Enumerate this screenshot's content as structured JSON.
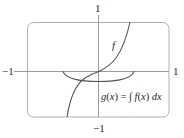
{
  "diagram": {
    "axes": {
      "x_min_label": "−1",
      "x_max_label": "1",
      "y_max_label": "1",
      "y_min_label": "−1"
    },
    "curves": [
      {
        "name": "f",
        "label": "f",
        "shape": "increasing S-curve through origin (cubic-like)"
      },
      {
        "name": "g",
        "label": "g(x) = ∫ f(x) dx",
        "shape": "bowl-shaped curve with minimum below origin, endpoints on x-axis"
      }
    ],
    "formula": {
      "g": "g",
      "open": "(",
      "x1": "x",
      "close": ")",
      "eq": " = ∫ ",
      "f": "f",
      "open2": "(",
      "x2": "x",
      "close2": ")",
      "d": " d",
      "x3": "x"
    },
    "colors": {
      "frame": "#a8a8a8",
      "axes": "#9a9a9a",
      "curves": "#555555",
      "text": "#2a2a2a"
    }
  }
}
